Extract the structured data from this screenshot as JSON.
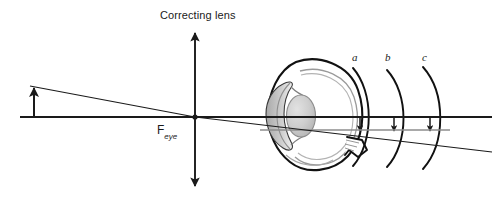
{
  "figure": {
    "width": 504,
    "height": 200,
    "background": "#ffffff",
    "type": "optics-ray-diagram"
  },
  "labels": {
    "title": "Correcting lens",
    "focal_point": "F",
    "focal_point_subscript": "eye",
    "arc_a": "a",
    "arc_b": "b",
    "arc_c": "c"
  },
  "colors": {
    "line": "#1a1a1a",
    "gray_line": "#8c8c8c",
    "eye_outline": "#111111",
    "eye_inner": "#9a9a9a",
    "lens_fill": "#c6c6c6",
    "sclera_fill": "#ffffff",
    "cornea_fill": "#bdbdbd",
    "text": "#1a1a1a"
  },
  "geometry": {
    "optical_axis": {
      "x1": 20,
      "y1": 117,
      "x2": 492,
      "y2": 117
    },
    "gray_image_line": {
      "x1": 260,
      "y1": 130,
      "x2": 450,
      "y2": 130
    },
    "lens_axis": {
      "x": 195,
      "y_top": 28,
      "y_bottom": 191
    },
    "object_arrow": {
      "x": 34,
      "y_base": 117,
      "y_tip": 86
    },
    "ray_through_center": {
      "x1": 31,
      "y1": 87,
      "x2": 492,
      "y2": 152
    },
    "ray_parallel_then_refracted": {
      "x1": 31,
      "y1": 87,
      "x2": 195,
      "y2": 117
    },
    "eye_center": {
      "x": 320,
      "y": 115
    },
    "arc_positions": [
      {
        "name": "a",
        "x": 358
      },
      {
        "name": "b",
        "x": 392
      },
      {
        "name": "c",
        "x": 428
      }
    ],
    "image_arrows": [
      {
        "x": 360,
        "y_top": 117,
        "y_bottom": 131
      },
      {
        "x": 394,
        "y_top": 117,
        "y_bottom": 131
      },
      {
        "x": 430,
        "y_top": 117,
        "y_bottom": 131
      }
    ]
  }
}
